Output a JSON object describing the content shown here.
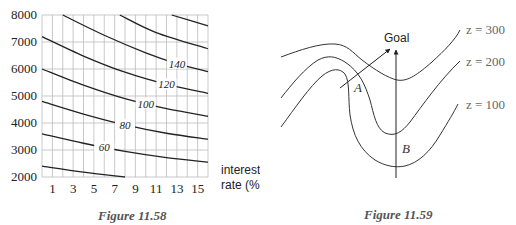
{
  "chart_data": [
    {
      "type": "contour",
      "caption": "Figure 11.58",
      "xlabel": "interest rate (%)",
      "xlabel_lines": [
        "interest",
        "rate (%)"
      ],
      "ylabel": "",
      "xlim": [
        0,
        16
      ],
      "ylim": [
        2000,
        8000
      ],
      "xticks": [
        1,
        3,
        5,
        7,
        9,
        11,
        13,
        15
      ],
      "yticks": [
        2000,
        3000,
        4000,
        5000,
        6000,
        7000,
        8000
      ],
      "grid": true,
      "grid_x_step": 1,
      "grid_y_step": 1000,
      "contours": [
        {
          "level": 40,
          "label": "",
          "points": [
            [
              0,
              2400
            ],
            [
              4,
              2180
            ],
            [
              8,
              2000
            ]
          ]
        },
        {
          "level": 60,
          "label": "60",
          "points": [
            [
              0,
              3600
            ],
            [
              4,
              3250
            ],
            [
              8,
              2950
            ],
            [
              12,
              2720
            ],
            [
              16,
              2550
            ]
          ]
        },
        {
          "level": 80,
          "label": "80",
          "points": [
            [
              0,
              4800
            ],
            [
              4,
              4330
            ],
            [
              8,
              3930
            ],
            [
              12,
              3620
            ],
            [
              16,
              3400
            ]
          ]
        },
        {
          "level": 100,
          "label": "100",
          "points": [
            [
              0,
              6000
            ],
            [
              4,
              5400
            ],
            [
              8,
              4900
            ],
            [
              12,
              4530
            ],
            [
              16,
              4250
            ]
          ]
        },
        {
          "level": 120,
          "label": "120",
          "points": [
            [
              0,
              7200
            ],
            [
              4,
              6480
            ],
            [
              8,
              5880
            ],
            [
              12,
              5430
            ],
            [
              16,
              5100
            ]
          ]
        },
        {
          "level": 140,
          "label": "140",
          "points": [
            [
              2,
              8000
            ],
            [
              6,
              7250
            ],
            [
              10,
              6600
            ],
            [
              13,
              6200
            ],
            [
              16,
              5900
            ]
          ]
        },
        {
          "level": 160,
          "label": "",
          "points": [
            [
              7.5,
              8000
            ],
            [
              11,
              7350
            ],
            [
              16,
              6750
            ]
          ]
        },
        {
          "level": 180,
          "label": "",
          "points": [
            [
              12.5,
              8000
            ],
            [
              16,
              7600
            ]
          ]
        }
      ],
      "label_positions": {
        "60": 6,
        "80": 8,
        "100": 10,
        "120": 12,
        "140": 13
      }
    },
    {
      "type": "diagram",
      "caption": "Figure 11.59",
      "goal_label": "Goal",
      "point_labels": [
        "A",
        "B"
      ],
      "contour_labels": [
        "z = 300",
        "z = 200",
        "z = 100"
      ]
    }
  ]
}
